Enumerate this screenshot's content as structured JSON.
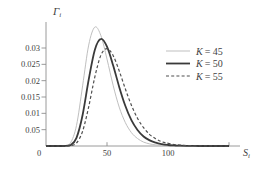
{
  "figure": {
    "colors": {
      "axis": "#8f8f8f",
      "text": "#3f3f3f",
      "background": "#ffffff"
    },
    "y_axis": {
      "symbol": "Γ",
      "subscript": "i",
      "ticks": [
        {
          "value": 0.03,
          "label": "0.03"
        },
        {
          "value": 0.025,
          "label": "0.025"
        },
        {
          "value": 0.02,
          "label": "0.02"
        },
        {
          "value": 0.015,
          "label": "0.015"
        },
        {
          "value": 0.01,
          "label": "0.01"
        },
        {
          "value": 0.005,
          "label": "0.05"
        }
      ]
    },
    "x_axis": {
      "symbol": "S",
      "subscript": "i",
      "origin_label": "0",
      "ticks": [
        {
          "value": 50,
          "label": "50"
        },
        {
          "value": 100,
          "label": "100"
        },
        {
          "value": 150,
          "label": ""
        }
      ]
    },
    "legend": [
      {
        "symbol": "K",
        "rest": "= 45",
        "color": "#bfbfbf",
        "width": 1,
        "dash": ""
      },
      {
        "symbol": "K",
        "rest": "= 50",
        "color": "#3a3a3a",
        "width": 1.8,
        "dash": ""
      },
      {
        "symbol": "K",
        "rest": "= 55",
        "color": "#4f4f4f",
        "width": 1.2,
        "dash": "3,2.2"
      }
    ]
  },
  "chart_data": {
    "type": "line",
    "title": "",
    "xlabel": "S_i",
    "ylabel": "Γ_i",
    "xlim": [
      0,
      158
    ],
    "ylim": [
      0,
      0.0375
    ],
    "grid": false,
    "legend_position": "right",
    "x": [
      0,
      5,
      10,
      15,
      20,
      25,
      30,
      35,
      40,
      45,
      50,
      55,
      60,
      65,
      70,
      75,
      80,
      85,
      90,
      95,
      100,
      105,
      110,
      115,
      120,
      125,
      130,
      135,
      140,
      145,
      150
    ],
    "series": [
      {
        "name": "K = 45",
        "color": "#bfbfbf",
        "line_width": 1,
        "dash": "",
        "values": [
          0,
          0,
          0,
          2e-05,
          0.00088,
          0.0063,
          0.0184,
          0.0309,
          0.0364,
          0.0338,
          0.0266,
          0.0186,
          0.0119,
          0.0072,
          0.0041,
          0.0023,
          0.0012,
          0.00064,
          0.00033,
          0.00017,
          8e-05,
          4e-05,
          2e-05,
          1e-05,
          0,
          0,
          0,
          0,
          0,
          0,
          0
        ]
      },
      {
        "name": "K = 50",
        "color": "#3a3a3a",
        "line_width": 1.8,
        "dash": "",
        "values": [
          0,
          0,
          0,
          0,
          0.00024,
          0.0025,
          0.0095,
          0.0203,
          0.0294,
          0.0328,
          0.0304,
          0.0247,
          0.0181,
          0.0123,
          0.0079,
          0.0049,
          0.0029,
          0.0017,
          0.001,
          0.00055,
          0.00031,
          0.00017,
          9e-05,
          5e-05,
          3e-05,
          1e-05,
          0,
          0,
          0,
          0,
          0
        ]
      },
      {
        "name": "K = 55",
        "color": "#4f4f4f",
        "line_width": 1.2,
        "dash": "3,2.2",
        "values": [
          0,
          0,
          0,
          0,
          7e-05,
          0.00091,
          0.0045,
          0.012,
          0.0211,
          0.0278,
          0.0298,
          0.0277,
          0.023,
          0.0175,
          0.0125,
          0.0085,
          0.0056,
          0.0035,
          0.0022,
          0.0013,
          0.0008,
          0.00047,
          0.00028,
          0.00016,
          9e-05,
          5e-05,
          3e-05,
          2e-05,
          1e-05,
          0,
          0
        ]
      }
    ]
  }
}
